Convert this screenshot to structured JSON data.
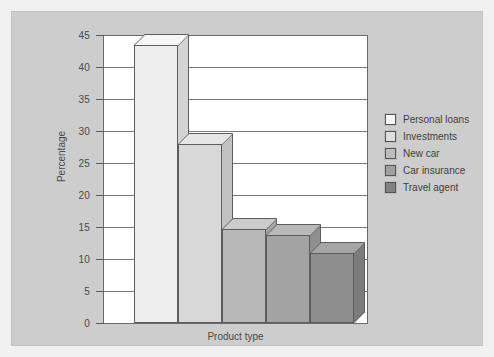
{
  "chart_data": {
    "type": "bar",
    "title": "",
    "xlabel": "Product type",
    "ylabel": "Percentage",
    "ylim": [
      0,
      45
    ],
    "ytick_step": 5,
    "yticks": [
      0,
      5,
      10,
      15,
      20,
      25,
      30,
      35,
      40,
      45
    ],
    "grid": true,
    "legend_position": "right",
    "categories": [
      "Personal loans",
      "Investments",
      "New car",
      "Car insurance",
      "Travel agent"
    ],
    "values": [
      43.5,
      27.9,
      14.7,
      13.7,
      10.9
    ],
    "series": [
      {
        "name": "Percentage",
        "values": [
          43.5,
          27.9,
          14.7,
          13.7,
          10.9
        ]
      }
    ],
    "bar_colors": [
      "#ededed",
      "#d8d8d8",
      "#b8b8b8",
      "#a3a3a3",
      "#8e8e8e"
    ],
    "bar_top_colors": [
      "#f7f7f7",
      "#e6e6e6",
      "#cccccc",
      "#b9b9b9",
      "#a5a5a5"
    ],
    "bar_side_colors": [
      "#d4d4d4",
      "#c2c2c2",
      "#a3a3a3",
      "#8f8f8f",
      "#7c7c7c"
    ]
  },
  "legend": {
    "items": [
      {
        "label": "Personal loans",
        "color": "#f5f5f5"
      },
      {
        "label": "Investments",
        "color": "#dedede"
      },
      {
        "label": "New car",
        "color": "#bdbdbd"
      },
      {
        "label": "Car insurance",
        "color": "#a0a0a0"
      },
      {
        "label": "Travel agent",
        "color": "#818181"
      }
    ]
  },
  "axes": {
    "y_title": "Percentage",
    "x_title": "Product type",
    "y_tick_labels": [
      "0",
      "5",
      "10",
      "15",
      "20",
      "25",
      "30",
      "35",
      "40",
      "45"
    ]
  },
  "colors": {
    "panel_background": "#cdcdcd",
    "plot_background": "#ffffff",
    "axis_line": "#5d5d5d",
    "gridline": "#7a7a7a",
    "text": "#4a4a4a"
  }
}
